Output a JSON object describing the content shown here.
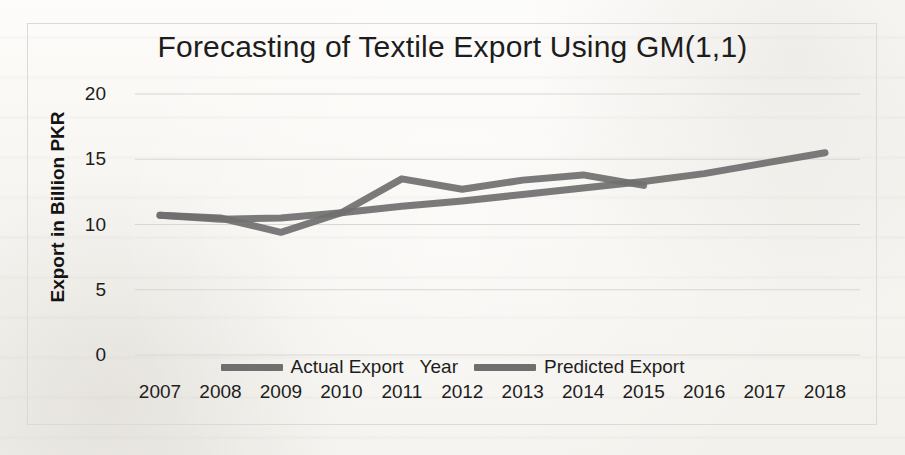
{
  "figure": {
    "title": "Forecasting of Textile Export Using GM(1,1)",
    "line_color": "#6f6f6f",
    "grid_color": "#d9d7d3",
    "text_color": "#1d1d1d",
    "background": "#fbfaf8"
  },
  "axes": {
    "y_title": "Export in Billion PKR",
    "x_title": "Year",
    "y_ticks": [
      "0",
      "5",
      "10",
      "15",
      "20"
    ],
    "x_ticks": [
      "2007",
      "2008",
      "2009",
      "2010",
      "2011",
      "2012",
      "2013",
      "2014",
      "2015",
      "2016",
      "2017",
      "2018"
    ]
  },
  "legend": {
    "items": [
      {
        "label": "Actual Export",
        "color": "#6f6f6f"
      },
      {
        "label": "Predicted Export",
        "color": "#6f6f6f"
      }
    ]
  },
  "chart_data": {
    "type": "line",
    "title": "Forecasting of Textile Export Using GM(1,1)",
    "xlabel": "Year",
    "ylabel": "Export in Billion PKR",
    "categories": [
      "2007",
      "2008",
      "2009",
      "2010",
      "2011",
      "2012",
      "2013",
      "2014",
      "2015",
      "2016",
      "2017",
      "2018"
    ],
    "x": [
      2007,
      2008,
      2009,
      2010,
      2011,
      2012,
      2013,
      2014,
      2015,
      2016,
      2017,
      2018
    ],
    "ylim": [
      0,
      20
    ],
    "yticks": [
      0,
      5,
      10,
      15,
      20
    ],
    "grid": true,
    "grid_axis": "y",
    "legend_position": "bottom",
    "series": [
      {
        "name": "Actual Export",
        "color": "#6f6f6f",
        "x": [
          2007,
          2008,
          2009,
          2010,
          2011,
          2012,
          2013,
          2014,
          2015
        ],
        "values": [
          10.7,
          10.5,
          9.4,
          10.9,
          13.5,
          12.7,
          13.4,
          13.8,
          13.0
        ]
      },
      {
        "name": "Predicted Export",
        "color": "#6f6f6f",
        "x": [
          2007,
          2008,
          2009,
          2010,
          2011,
          2012,
          2013,
          2014,
          2015,
          2016,
          2017,
          2018
        ],
        "values": [
          10.7,
          10.4,
          10.5,
          10.9,
          11.4,
          11.8,
          12.3,
          12.8,
          13.3,
          13.9,
          14.7,
          15.5
        ]
      }
    ]
  }
}
